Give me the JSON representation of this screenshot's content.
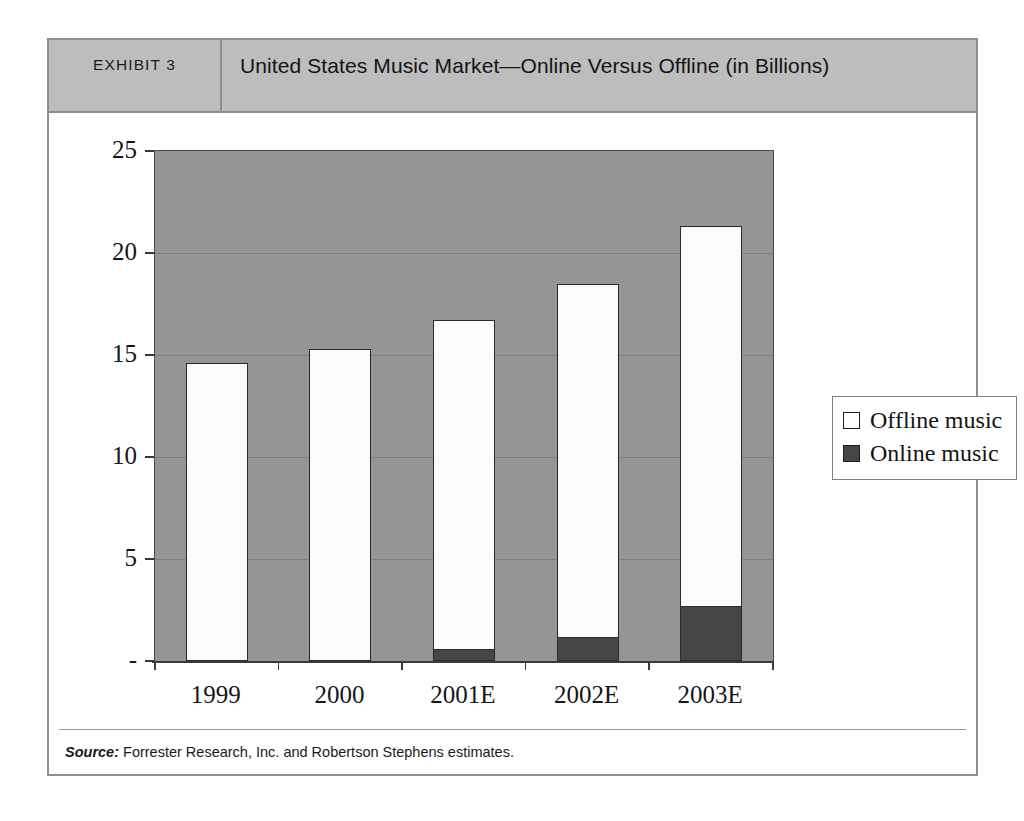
{
  "exhibit": {
    "label": "EXHIBIT 3",
    "title": "United States Music Market—Online Versus Offline (in Billions)",
    "source_label": "Source:",
    "source_text": "Forrester Research, Inc. and Robertson Stephens estimates."
  },
  "legend": {
    "offline": "Offline  music",
    "online": "Online music"
  },
  "axis": {
    "y_ticks": [
      "25",
      "20",
      "15",
      "10",
      "5",
      "-"
    ],
    "x_ticks": [
      "1999",
      "2000",
      "2001E",
      "2002E",
      "2003E"
    ]
  },
  "colors": {
    "plot_background": "#959595",
    "header_background": "#bdbdbd",
    "offline_bar": "#fbfbfb",
    "online_bar": "#464646",
    "border": "#8d8d8d",
    "axis": "#3a3a3a"
  },
  "chart_data": {
    "type": "bar",
    "stacked": true,
    "title": "United States Music Market—Online Versus Offline (in Billions)",
    "xlabel": "",
    "ylabel": "",
    "ylim": [
      0,
      25
    ],
    "yticks": [
      0,
      5,
      10,
      15,
      20,
      25
    ],
    "ytick_labels": [
      "-",
      "5",
      "10",
      "15",
      "20",
      "25"
    ],
    "grid": true,
    "legend_position": "right",
    "categories": [
      "1999",
      "2000",
      "2001E",
      "2002E",
      "2003E"
    ],
    "series": [
      {
        "name": "Online music",
        "color": "#464646",
        "values": [
          0,
          0,
          0.6,
          1.2,
          2.7
        ]
      },
      {
        "name": "Offline music",
        "color": "#fbfbfb",
        "values": [
          14.6,
          15.3,
          16.1,
          17.3,
          18.6
        ]
      }
    ],
    "totals": [
      14.6,
      15.3,
      16.7,
      18.5,
      21.3
    ],
    "units": "Billions of US dollars",
    "source": "Forrester Research, Inc. and Robertson Stephens estimates."
  }
}
